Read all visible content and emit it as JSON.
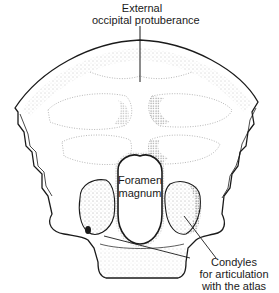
{
  "figure": {
    "style": "stippled line drawing",
    "colors": {
      "ink": "#1a1a1a",
      "stipple": "#555555",
      "background": "#ffffff"
    }
  },
  "labels": {
    "external_occipital_protuberance": {
      "line1": "External",
      "line2": "occipital protuberance"
    },
    "foramen_magnum": {
      "line1": "Foramen",
      "line2": "magnum"
    },
    "condyles": {
      "line1": "Condyles",
      "line2": "for articulation",
      "line3": "with the atlas"
    }
  }
}
